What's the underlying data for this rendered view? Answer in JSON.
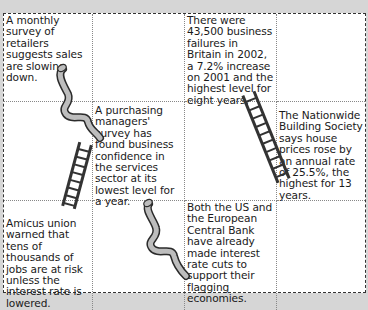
{
  "board": {
    "cells": [
      {
        "row": 0,
        "col": 0,
        "text": "A monthly survey of retailers suggests sales are slowing down."
      },
      {
        "row": 0,
        "col": 1,
        "text": ""
      },
      {
        "row": 0,
        "col": 2,
        "text": "There were 43,500 business failures in Britain in 2002, a 7.2% increase on 2001 and the highest level for eight years."
      },
      {
        "row": 0,
        "col": 3,
        "text": ""
      },
      {
        "row": 1,
        "col": 0,
        "text": ""
      },
      {
        "row": 1,
        "col": 1,
        "text": "A purchasing managers' survey has found business confidence in the services sector at its lowest level for a year."
      },
      {
        "row": 1,
        "col": 2,
        "text": ""
      },
      {
        "row": 1,
        "col": 3,
        "text": "The Nationwide Building Society says house prices rose by an annual rate of 25.5%, the highest for 13 years."
      },
      {
        "row": 2,
        "col": 0,
        "text": "Amicus union warned that tens of thousands of jobs are at risk unless the interest rate is lowered."
      },
      {
        "row": 2,
        "col": 1,
        "text": ""
      },
      {
        "row": 2,
        "col": 2,
        "text": "Both the US and the European Central Bank have already made interest rate cuts to support their flagging economies."
      },
      {
        "row": 2,
        "col": 3,
        "text": ""
      }
    ]
  },
  "illustrations": {
    "snakes": 2,
    "ladders": 2,
    "snake_fill": "#bdbdbd",
    "outline": "#2b2b2b"
  }
}
